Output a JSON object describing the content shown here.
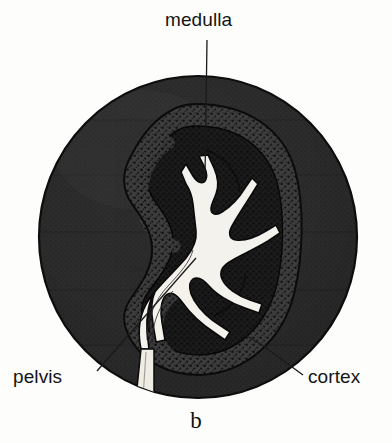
{
  "figure": {
    "panel_label": "b",
    "background_color": "#fdfdfb"
  },
  "labels": {
    "medulla": "medulla",
    "pelvis": "pelvis",
    "cortex": "cortex"
  },
  "colors": {
    "paper": "#fdfdfb",
    "disc_dark": "#2a2a2a",
    "disc_edge": "#171717",
    "kidney_medulla": "#1b1b1b",
    "kidney_cortex": "#3a3a3a",
    "pelvis_white": "#f6f4ee",
    "leader_line": "#1a1a1a",
    "text": "#141414"
  },
  "structures": {
    "outer_disc": "dark circular mount/background disc",
    "kidney_outline": "bean-shaped kidney section",
    "cortex_band": "speckled outer band of kidney",
    "medulla_region": "dark inner region of kidney",
    "renal_pelvis": "white branching calyces and pelvis",
    "ureter": "white strip descending from hilum"
  }
}
